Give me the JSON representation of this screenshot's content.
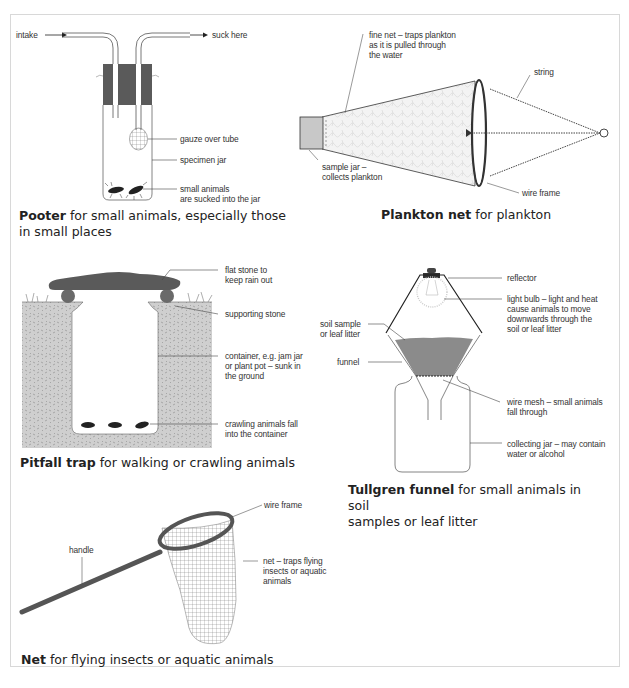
{
  "colors": {
    "dark_fill": "#5a5a5a",
    "soil": "#c9c9c9",
    "line": "#444444",
    "border": "#d8d8d8"
  },
  "pooter": {
    "labels": {
      "intake": "intake",
      "suck_here": "suck here",
      "gauze": "gauze over tube",
      "jar": "specimen jar",
      "animals": "small animals\nare sucked into the jar"
    },
    "caption_bold": "Pooter",
    "caption_rest": " for small animals, especially those\nin small places"
  },
  "plankton_net": {
    "labels": {
      "fine_net": "fine net – traps plankton\nas it is pulled through\nthe water",
      "string": "string",
      "sample_jar": "sample jar –\ncollects plankton",
      "wire_frame": "wire frame"
    },
    "caption_bold": "Plankton net",
    "caption_rest": " for plankton"
  },
  "pitfall_trap": {
    "labels": {
      "flat_stone": "flat stone to\nkeep rain out",
      "supporting_stone": "supporting stone",
      "container": "container, e.g. jam jar\nor plant pot – sunk in\nthe ground",
      "crawling": "crawling animals fall\ninto the container"
    },
    "caption_bold": "Pitfall trap",
    "caption_rest": " for walking or crawling animals"
  },
  "tullgren_funnel": {
    "labels": {
      "reflector": "reflector",
      "light_bulb": "light bulb – light and heat\ncause animals to move\ndownwards through the\nsoil or leaf litter",
      "soil_sample": "soil sample\nor leaf litter",
      "funnel": "funnel",
      "wire_mesh": "wire mesh – small animals\nfall through",
      "collecting_jar": "collecting jar – may contain\nwater or alcohol"
    },
    "caption_bold": "Tullgren funnel",
    "caption_rest": " for small animals in soil\nsamples or leaf litter"
  },
  "net": {
    "labels": {
      "wire_frame": "wire frame",
      "handle": "handle",
      "net": "net – traps flying\ninsects or aquatic\nanimals"
    },
    "caption_bold": "Net",
    "caption_rest": " for flying insects or aquatic animals"
  }
}
